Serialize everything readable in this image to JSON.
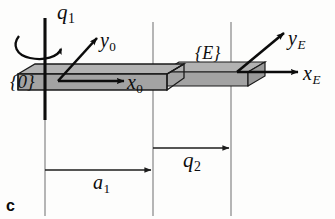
{
  "figure": {
    "caption_letter": "c",
    "background_color": "#fdfdfc"
  },
  "frames": [
    {
      "id": "base",
      "label": "{0}",
      "origin_x": 60,
      "origin_y": 80,
      "axes": [
        {
          "name": "x0",
          "base": "x",
          "subscript": "0",
          "direction": "right",
          "tip_x": 126,
          "tip_y": 80
        },
        {
          "name": "y0",
          "base": "y",
          "subscript": "0",
          "direction": "up-right",
          "tip_x": 98,
          "tip_y": 38
        }
      ]
    },
    {
      "id": "end-effector",
      "label": "{E}",
      "origin_x": 237,
      "origin_y": 72,
      "axes": [
        {
          "name": "xE",
          "base": "x",
          "subscript": "E",
          "direction": "right",
          "tip_x": 300,
          "tip_y": 72
        },
        {
          "name": "yE",
          "base": "y",
          "subscript": "E",
          "direction": "up-right",
          "tip_x": 285,
          "tip_y": 32
        }
      ]
    }
  ],
  "joints": [
    {
      "id": "revolute-1",
      "label": "q",
      "subscript": "1",
      "type": "revolute",
      "axis": "vertical",
      "axis_x": 45,
      "axis_top_y": 18,
      "axis_bottom_y": 120,
      "rotation_arrow": "counterclockwise-about-vertical-axis"
    },
    {
      "id": "prismatic-2",
      "label": "q",
      "subscript": "2",
      "type": "prismatic",
      "axis": "horizontal",
      "from_x": 153,
      "to_x": 231,
      "dimension_y": 148
    }
  ],
  "dimensions": [
    {
      "id": "a1",
      "label": "a",
      "subscript": "1",
      "from_x": 45,
      "to_x": 153,
      "y": 170,
      "arrow": "right"
    },
    {
      "id": "q2",
      "label": "q",
      "subscript": "2",
      "from_x": 153,
      "to_x": 231,
      "y": 148,
      "arrow": "right"
    }
  ],
  "reference_lines": [
    {
      "id": "line-base",
      "x": 45,
      "y_top": 22,
      "y_bottom": 216
    },
    {
      "id": "line-middle",
      "x": 153,
      "y_top": 22,
      "y_bottom": 216
    },
    {
      "id": "line-right",
      "x": 231,
      "y_top": 22,
      "y_bottom": 216
    }
  ],
  "links": [
    {
      "id": "link-1-outer",
      "shape": "rectangular-prism",
      "top_face_color": "#b2b2b2",
      "front_face_color": "#a3a3a3",
      "edge_color": "#1a1a1a"
    },
    {
      "id": "link-2-sliding",
      "shape": "rectangular-prism",
      "top_face_color": "#b2b2b2",
      "front_face_color": "#a3a3a3",
      "edge_color": "#1a1a1a"
    }
  ],
  "colors": {
    "ink": "#0c0c0c",
    "reference_line": "#8a8a8a",
    "prism_top": "#b2b2b2",
    "prism_front": "#a3a3a3",
    "prism_edge": "#1a1a1a"
  }
}
